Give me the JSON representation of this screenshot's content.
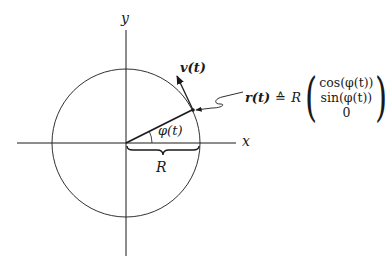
{
  "figure": {
    "axes": {
      "x_label": "x",
      "y_label": "y"
    },
    "circle": {
      "center": [
        126,
        143
      ],
      "radius": 74
    },
    "angle_label": "φ(t)",
    "radius_label": "R",
    "velocity_label": "v(t)",
    "formula": {
      "lhs": "r(t)",
      "relation": "≙",
      "scalar": "R",
      "vector": [
        "cos(φ(t))",
        "sin(φ(t))",
        "0"
      ]
    },
    "colors": {
      "stroke": "#1a1a1a",
      "background": "#ffffff"
    }
  }
}
